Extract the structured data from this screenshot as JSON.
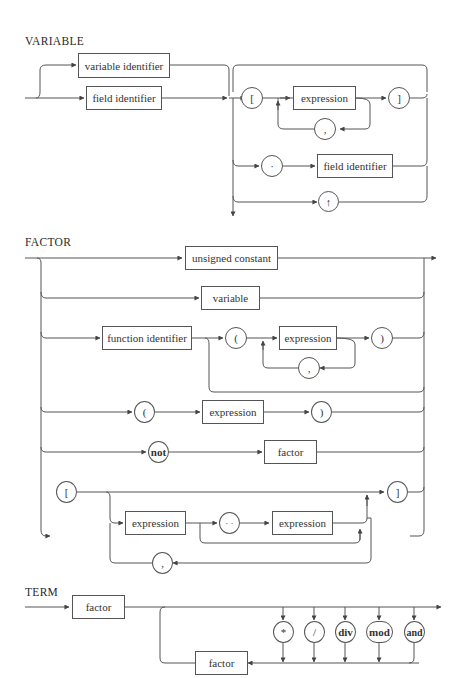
{
  "header_fragment": "",
  "variable": {
    "title": "VARIABLE",
    "variable_identifier": "variable identifier",
    "field_identifier_1": "field identifier",
    "lbracket": "[",
    "expression": "expression",
    "rbracket": "]",
    "comma": ",",
    "dot": "·",
    "field_identifier_2": "field identifier",
    "pointer": "↑"
  },
  "factor": {
    "title": "FACTOR",
    "unsigned_constant": "unsigned constant",
    "variable": "variable",
    "function_identifier": "function identifier",
    "lparen_1": "(",
    "expression_1": "expression",
    "rparen_1": ")",
    "comma_1": ",",
    "lparen_2": "(",
    "expression_2": "expression",
    "rparen_2": ")",
    "not": "not",
    "factor": "factor",
    "lbracket": "[",
    "rbracket": "]",
    "expression_3": "expression",
    "range": "· ·",
    "expression_4": "expression",
    "comma_2": ","
  },
  "term": {
    "title": "TERM",
    "factor_1": "factor",
    "op_mul": "*",
    "op_div_slash": "/",
    "op_div": "div",
    "op_mod": "mod",
    "op_and": "and",
    "factor_2": "factor"
  },
  "colors": {
    "line": "#555555",
    "text": "#2a2a2a",
    "background": "#ffffff"
  }
}
